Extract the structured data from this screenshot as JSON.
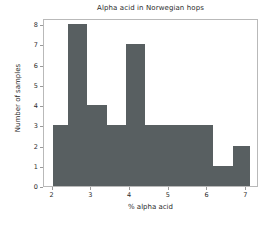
{
  "chart_data": {
    "type": "bar",
    "title": "Alpha acid in Norwegian hops",
    "xlabel": "% alpha acid",
    "ylabel": "Number of samples",
    "xlim": [
      1.78,
      7.33
    ],
    "ylim": [
      0,
      8.3
    ],
    "grid": false,
    "legend": null,
    "bar_color": "#585f61",
    "frame_color": "#b9b9b9",
    "xticks": [
      2,
      3,
      4,
      5,
      6,
      7
    ],
    "xtick_labels": [
      "2",
      "3",
      "4",
      "5",
      "6",
      "7"
    ],
    "yticks": [
      0,
      1,
      2,
      3,
      4,
      5,
      6,
      7,
      8
    ],
    "ytick_labels": [
      "0",
      "1",
      "2",
      "3",
      "4",
      "5",
      "6",
      "7",
      "8"
    ],
    "bins": [
      2.0,
      2.4,
      2.9,
      3.4,
      3.9,
      4.4,
      6.15,
      6.65,
      7.1
    ],
    "bars": [
      {
        "x0": 2.0,
        "x1": 2.4,
        "value": 3
      },
      {
        "x0": 2.4,
        "x1": 2.9,
        "value": 8
      },
      {
        "x0": 2.9,
        "x1": 3.4,
        "value": 4
      },
      {
        "x0": 3.4,
        "x1": 3.9,
        "value": 3
      },
      {
        "x0": 3.9,
        "x1": 4.4,
        "value": 7
      },
      {
        "x0": 4.4,
        "x1": 6.15,
        "value": 3
      },
      {
        "x0": 6.15,
        "x1": 6.65,
        "value": 1
      },
      {
        "x0": 6.65,
        "x1": 7.1,
        "value": 2
      }
    ],
    "categories": [
      "2.0-2.4",
      "2.4-2.9",
      "2.9-3.4",
      "3.4-3.9",
      "3.9-4.4",
      "4.4-6.15",
      "6.15-6.65",
      "6.65-7.1"
    ],
    "values": [
      3,
      8,
      4,
      3,
      7,
      3,
      1,
      2
    ]
  }
}
